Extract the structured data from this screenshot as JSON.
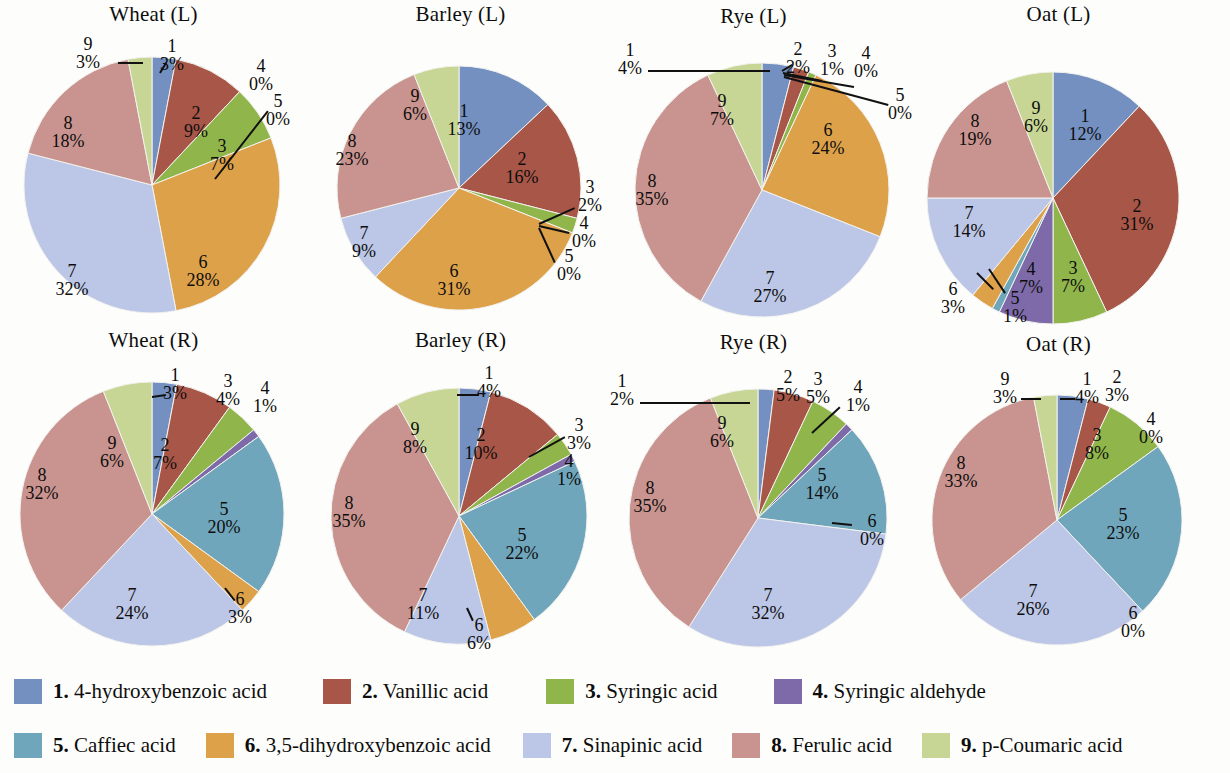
{
  "chart_data": {
    "type": "pie",
    "title": "",
    "series_labels": [
      "1",
      "2",
      "3",
      "4",
      "5",
      "6",
      "7",
      "8",
      "9"
    ],
    "legend": {
      "position": "bottom",
      "entries": [
        {
          "id": "1",
          "label": "4-hydroxybenzoic acid",
          "color": "#7390c0"
        },
        {
          "id": "2",
          "label": "Vanillic acid",
          "color": "#a85647"
        },
        {
          "id": "3",
          "label": "Syringic acid",
          "color": "#90b54b"
        },
        {
          "id": "4",
          "label": "Syringic aldehyde",
          "color": "#7e6aa8"
        },
        {
          "id": "5",
          "label": "Caffiec acid",
          "color": "#6fa6bb"
        },
        {
          "id": "6",
          "label": "3,5-dihydroxybenzoic acid",
          "color": "#dea councils"
        },
        {
          "id": "7",
          "label": "Sinapinic acid",
          "color": "#bcc6e6"
        },
        {
          "id": "8",
          "label": "Ferulic acid",
          "color": "#c9948f"
        },
        {
          "id": "9",
          "label": "p-Coumaric acid",
          "color": "#c7d694"
        }
      ]
    },
    "charts": [
      {
        "title": "Wheat (L)",
        "categories": [
          "1",
          "2",
          "3",
          "4",
          "5",
          "6",
          "7",
          "8",
          "9"
        ],
        "values": [
          3,
          9,
          7,
          0,
          0,
          28,
          32,
          18,
          3
        ],
        "value_labels": [
          "3%",
          "9%",
          "7%",
          "0%",
          "0%",
          "28%",
          "32%",
          "18%",
          "3%"
        ]
      },
      {
        "title": "Barley (L)",
        "categories": [
          "1",
          "2",
          "3",
          "4",
          "5",
          "6",
          "7",
          "8",
          "9"
        ],
        "values": [
          13,
          16,
          2,
          0,
          0,
          31,
          9,
          23,
          6
        ],
        "value_labels": [
          "13%",
          "16%",
          "2%",
          "0%",
          "0%",
          "31%",
          "9%",
          "23%",
          "6%"
        ]
      },
      {
        "title": "Rye (L)",
        "categories": [
          "1",
          "2",
          "3",
          "4",
          "5",
          "6",
          "7",
          "8",
          "9"
        ],
        "values": [
          4,
          2,
          1,
          0,
          0,
          24,
          27,
          35,
          7
        ],
        "value_labels": [
          "4%",
          "2%",
          "1%",
          "0%",
          "0%",
          "24%",
          "27%",
          "35%",
          "7%"
        ]
      },
      {
        "title": "Oat (L)",
        "categories": [
          "1",
          "2",
          "3",
          "4",
          "5",
          "6",
          "7",
          "8",
          "9"
        ],
        "values": [
          12,
          31,
          7,
          7,
          1,
          3,
          14,
          19,
          6
        ],
        "value_labels": [
          "12%",
          "31%",
          "7%",
          "7%",
          "1%",
          "3%",
          "14%",
          "19%",
          "6%"
        ]
      },
      {
        "title": "Wheat (R)",
        "categories": [
          "1",
          "2",
          "3",
          "4",
          "5",
          "6",
          "7",
          "8",
          "9"
        ],
        "values": [
          3,
          7,
          4,
          1,
          20,
          3,
          24,
          32,
          6
        ],
        "value_labels": [
          "3%",
          "7%",
          "4%",
          "1%",
          "20%",
          "3%",
          "24%",
          "32%",
          "6%"
        ]
      },
      {
        "title": "Barley (R)",
        "categories": [
          "1",
          "2",
          "3",
          "4",
          "5",
          "6",
          "7",
          "8",
          "9"
        ],
        "values": [
          4,
          10,
          3,
          1,
          22,
          6,
          11,
          35,
          8
        ],
        "value_labels": [
          "4%",
          "10%",
          "3%",
          "1%",
          "22%",
          "6%",
          "11%",
          "35%",
          "8%"
        ]
      },
      {
        "title": "Rye (R)",
        "categories": [
          "1",
          "2",
          "3",
          "4",
          "5",
          "6",
          "7",
          "8",
          "9"
        ],
        "values": [
          2,
          5,
          5,
          1,
          14,
          0,
          32,
          35,
          6
        ],
        "value_labels": [
          "2%",
          "5%",
          "5%",
          "1%",
          "14%",
          "0%",
          "32%",
          "35%",
          "6%"
        ]
      },
      {
        "title": "Oat (R)",
        "categories": [
          "1",
          "2",
          "3",
          "4",
          "5",
          "6",
          "7",
          "8",
          "9"
        ],
        "values": [
          4,
          3,
          8,
          0,
          23,
          0,
          26,
          33,
          3
        ],
        "value_labels": [
          "4%",
          "3%",
          "8%",
          "0%",
          "23%",
          "0%",
          "26%",
          "33%",
          "3%"
        ]
      }
    ]
  },
  "colors": {
    "c1": "#7390c0",
    "c2": "#a85647",
    "c3": "#90b54b",
    "c4": "#7e6aa8",
    "c5": "#6fa6bb",
    "c6": "#dda14a",
    "c7": "#bcc6e6",
    "c8": "#c9948f",
    "c9": "#c7d694"
  },
  "legend": {
    "row1": [
      {
        "n": "1.",
        "t": "4-hydroxybenzoic acid"
      },
      {
        "n": "2.",
        "t": "Vanillic acid"
      },
      {
        "n": "3.",
        "t": "Syringic acid"
      },
      {
        "n": "4.",
        "t": "Syringic aldehyde"
      }
    ],
    "row2": [
      {
        "n": "5.",
        "t": "Caffiec acid"
      },
      {
        "n": "6.",
        "t": "3,5-dihydroxybenzoic acid"
      },
      {
        "n": "7.",
        "t": "Sinapinic acid"
      },
      {
        "n": "8.",
        "t": "Ferulic acid"
      },
      {
        "n": "9.",
        "t": "p-Coumaric acid"
      }
    ]
  }
}
